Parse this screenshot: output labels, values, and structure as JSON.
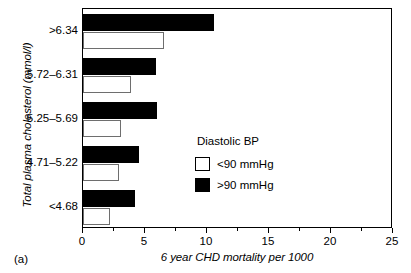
{
  "panel": {
    "label": "(a)"
  },
  "legend": {
    "title": "Diastolic BP",
    "entries": [
      {
        "label": "<90 mmHg",
        "swatch": "white-square-icon",
        "color": "#ffffff"
      },
      {
        "label": ">90 mmHg",
        "swatch": "black-square-icon",
        "color": "#000000"
      }
    ]
  },
  "chart_data": {
    "type": "bar",
    "orientation": "horizontal",
    "title": "",
    "xlabel": "6 year CHD mortality per 1000",
    "ylabel": "Total plasma cholesterol (mmol/l)",
    "categories": [
      ">6.34",
      "5.72–6.31",
      "5.25–5.69",
      "4.71–5.22",
      "<4.68"
    ],
    "series": [
      {
        "name": ">90 mmHg",
        "color": "#000000",
        "values": [
          10.6,
          5.9,
          6.0,
          4.5,
          4.2
        ]
      },
      {
        "name": "<90 mmHg",
        "color": "#ffffff",
        "values": [
          6.5,
          3.9,
          3.1,
          2.9,
          2.2
        ]
      }
    ],
    "xlim": [
      0,
      25
    ],
    "xticks": [
      0,
      5,
      10,
      15,
      20,
      25
    ],
    "xticklabels": [
      "0",
      "5",
      "10",
      "15",
      "20",
      "25"
    ],
    "xminorticks": [
      2.5,
      7.5,
      12.5,
      17.5,
      22.5
    ],
    "grid": false,
    "legend_position": "lower-right-inside"
  }
}
